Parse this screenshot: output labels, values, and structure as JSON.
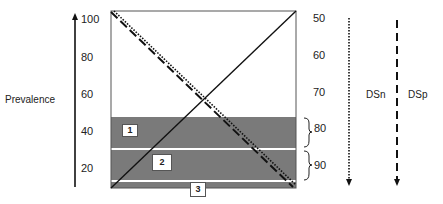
{
  "prevalence_axis": {
    "title": "Prevalence",
    "ticks": [
      "100",
      "80",
      "60",
      "40",
      "20"
    ]
  },
  "right_axis": {
    "ticks": [
      "50",
      "60",
      "70",
      "80",
      "90"
    ]
  },
  "regions": [
    {
      "label": "1",
      "brace_value": "80"
    },
    {
      "label": "2",
      "brace_value": "90"
    },
    {
      "label": "3"
    }
  ],
  "legend": {
    "dsn_label": "DSn",
    "dsp_label": "DSp"
  },
  "colors": {
    "band": "#7a7a7a",
    "line": "#111111",
    "separator": "#ffffff"
  }
}
